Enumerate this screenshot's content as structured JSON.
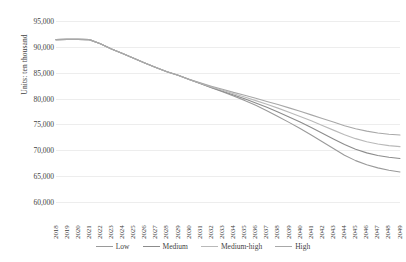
{
  "chart_data": {
    "type": "line",
    "title": "",
    "xlabel": "",
    "ylabel": "Units: ten thousand",
    "ylim": [
      60000,
      95000
    ],
    "yticks": [
      60000,
      65000,
      70000,
      75000,
      80000,
      85000,
      90000,
      95000
    ],
    "ytick_labels": [
      "60,000",
      "65,000",
      "70,000",
      "75,000",
      "80,000",
      "85,000",
      "90,000",
      "95,000"
    ],
    "grid": true,
    "legend_position": "bottom",
    "categories": [
      "2018",
      "2019",
      "2020",
      "2021",
      "2022",
      "2023",
      "2024",
      "2025",
      "2026",
      "2027",
      "2028",
      "2029",
      "2030",
      "2031",
      "2032",
      "2033",
      "2034",
      "2035",
      "2036",
      "2037",
      "2038",
      "2039",
      "2040",
      "2041",
      "2042",
      "2043",
      "2044",
      "2045",
      "2046",
      "2047",
      "2048",
      "2049"
    ],
    "series": [
      {
        "name": "Low",
        "color": "#9a9a9a",
        "values": [
          91400,
          91450,
          91450,
          91400,
          90600,
          89600,
          88700,
          87800,
          86900,
          86000,
          85200,
          84500,
          83700,
          82900,
          82100,
          81300,
          80500,
          79650,
          78700,
          77650,
          76550,
          75400,
          74200,
          72950,
          71650,
          70350,
          69050,
          68000,
          67200,
          66600,
          66150,
          65800
        ]
      },
      {
        "name": "Medium",
        "color": "#8c8c8c",
        "values": [
          91400,
          91450,
          91450,
          91400,
          90600,
          89600,
          88700,
          87800,
          86900,
          86000,
          85200,
          84500,
          83700,
          82900,
          82150,
          81400,
          80700,
          79950,
          79150,
          78300,
          77400,
          76450,
          75450,
          74400,
          73300,
          72200,
          71100,
          70200,
          69500,
          69000,
          68650,
          68400
        ]
      },
      {
        "name": "Medium-high",
        "color": "#b9b9b9",
        "values": [
          91400,
          91450,
          91450,
          91400,
          90600,
          89600,
          88700,
          87800,
          86900,
          86000,
          85200,
          84500,
          83700,
          82950,
          82250,
          81600,
          80950,
          80300,
          79600,
          78900,
          78150,
          77350,
          76550,
          75700,
          74800,
          73900,
          73000,
          72250,
          71650,
          71200,
          70900,
          70700
        ]
      },
      {
        "name": "High",
        "color": "#a8a8a8",
        "values": [
          91400,
          91450,
          91450,
          91400,
          90600,
          89600,
          88700,
          87800,
          86900,
          86000,
          85200,
          84500,
          83750,
          83050,
          82400,
          81800,
          81200,
          80650,
          80050,
          79450,
          78850,
          78200,
          77550,
          76850,
          76150,
          75450,
          74750,
          74150,
          73700,
          73350,
          73100,
          72950
        ]
      }
    ]
  }
}
